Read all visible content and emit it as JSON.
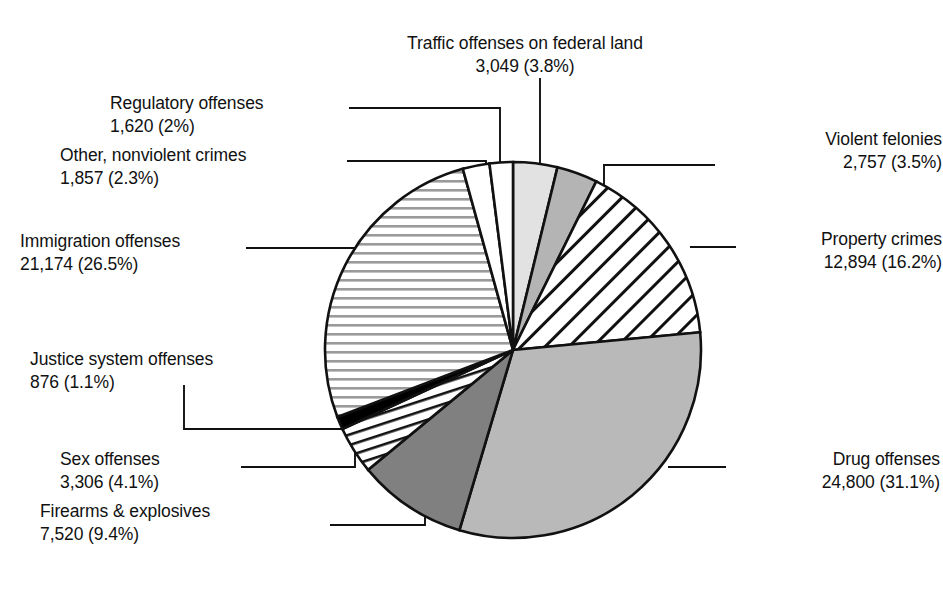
{
  "chart_data": {
    "type": "pie",
    "title": "",
    "total": 79853,
    "legend_position": "callout-labels",
    "grid": false,
    "start_angle_deg": -90,
    "direction": "clockwise",
    "categories": [
      "Traffic offenses on federal land",
      "Violent felonies",
      "Property crimes",
      "Drug offenses",
      "Firearms & explosives",
      "Sex offenses",
      "Justice system offenses",
      "Immigration offenses",
      "Other, nonviolent crimes",
      "Regulatory offenses"
    ],
    "values": [
      3049,
      2757,
      12894,
      24800,
      7520,
      3306,
      876,
      21174,
      1857,
      1620
    ],
    "percents": [
      3.8,
      3.5,
      16.2,
      31.1,
      9.4,
      4.1,
      1.1,
      26.5,
      2.3,
      2.0
    ],
    "value_labels": [
      "3,049",
      "2,757",
      "12,894",
      "24,800",
      "7,520",
      "3,306",
      "876",
      "21,174",
      "1,857",
      "1,620"
    ],
    "percent_labels": [
      "(3.8%)",
      "(3.5%)",
      "(16.2%)",
      "(31.1%)",
      "(9.4%)",
      "(4.1%)",
      "(1.1%)",
      "(26.5%)",
      "(2.3%)",
      "(2%)"
    ],
    "fills": [
      "#e2e2e2",
      "#b4b4b4",
      "diagonal-hatch",
      "#b9b9b9",
      "#808080",
      "vertical-hatch",
      "#000000",
      "horizontal-hatch",
      "#ffffff",
      "#ffffff"
    ],
    "stroke_color": "#111111"
  },
  "labels": {
    "traffic": {
      "name": "Traffic offenses on federal land",
      "stat": "3,049 (3.8%)"
    },
    "regulatory": {
      "name": "Regulatory offenses",
      "stat": "1,620 (2%)"
    },
    "other": {
      "name": "Other, nonviolent crimes",
      "stat": "1,857 (2.3%)"
    },
    "immigration": {
      "name": "Immigration offenses",
      "stat": "21,174 (26.5%)"
    },
    "justice": {
      "name": "Justice system offenses",
      "stat": "876 (1.1%)"
    },
    "sex": {
      "name": "Sex offenses",
      "stat": "3,306 (4.1%)"
    },
    "firearms": {
      "name": "Firearms & explosives",
      "stat": "7,520 (9.4%)"
    },
    "violent": {
      "name": "Violent felonies",
      "stat": "2,757 (3.5%)"
    },
    "property": {
      "name": "Property crimes",
      "stat": "12,894 (16.2%)"
    },
    "drug": {
      "name": "Drug offenses",
      "stat": "24,800 (31.1%)"
    }
  }
}
